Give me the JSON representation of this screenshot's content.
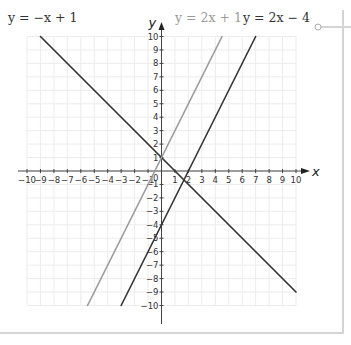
{
  "graph": {
    "x_axis_label": "x",
    "y_axis_label": "y",
    "origin_label": "0",
    "x_ticks_neg": [
      "−10",
      "−9",
      "−8",
      "−7",
      "−6",
      "−5",
      "−4",
      "−3",
      "−2",
      "−1"
    ],
    "x_ticks_pos": [
      "1",
      "2",
      "3",
      "4",
      "5",
      "6",
      "7",
      "8",
      "9",
      "10"
    ],
    "y_ticks_pos": [
      "1",
      "2",
      "3",
      "4",
      "5",
      "6",
      "7",
      "8",
      "9",
      "10"
    ],
    "y_ticks_neg": [
      "−1",
      "−2",
      "−3",
      "−4",
      "−5",
      "−6",
      "−7",
      "−8",
      "−9",
      "−10"
    ],
    "labels": {
      "line1": "y = −x + 1",
      "line2": "y = 2x + 1",
      "line3": "y = 2x − 4"
    },
    "colors": {
      "dark_line": "#333333",
      "light_line": "#9a9a9a",
      "grid": "#ececec",
      "axis": "#444444"
    }
  },
  "chart_data": {
    "type": "line",
    "title": "",
    "xlabel": "x",
    "ylabel": "y",
    "xlim": [
      -10,
      10
    ],
    "ylim": [
      -10,
      10
    ],
    "grid": true,
    "series": [
      {
        "name": "y = −x + 1",
        "x": [
          -9,
          10
        ],
        "y": [
          10,
          -9
        ],
        "color": "#333333"
      },
      {
        "name": "y = 2x + 1",
        "x": [
          -5.5,
          4.5
        ],
        "y": [
          -10,
          10
        ],
        "color": "#9a9a9a"
      },
      {
        "name": "y = 2x − 4",
        "x": [
          -3,
          7
        ],
        "y": [
          -10,
          10
        ],
        "color": "#333333"
      }
    ]
  }
}
